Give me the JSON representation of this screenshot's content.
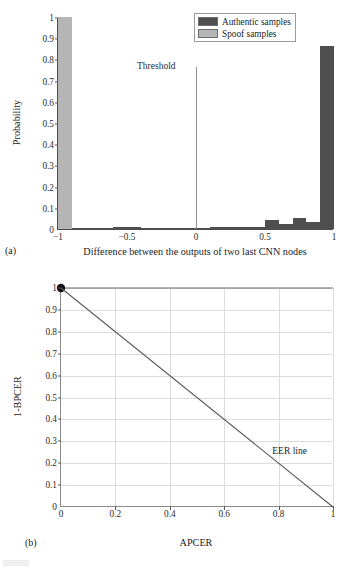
{
  "figure": {
    "background": "#ffffff"
  },
  "panel_a": {
    "subfig_label": "(a)",
    "threshold_label": "Threshold",
    "legend": {
      "items": [
        {
          "label": "Authentic samples",
          "color": "#4f4f4f"
        },
        {
          "label": "Spoof samples",
          "color": "#b5b5b5"
        }
      ]
    },
    "chart_data": {
      "type": "bar",
      "title": "",
      "xlabel": "Difference between the outputs of two last CNN nodes",
      "ylabel": "Probability",
      "xlim": [
        -1,
        1
      ],
      "ylim": [
        0,
        1
      ],
      "grid": false,
      "xticks": [
        "-1",
        "-0.5",
        "0",
        "0.5",
        "1"
      ],
      "xtick_values": [
        -1,
        -0.5,
        0,
        0.5,
        1
      ],
      "yticks": [
        "0",
        "0.1",
        "0.2",
        "0.3",
        "0.4",
        "0.5",
        "0.6",
        "0.7",
        "0.8",
        "0.9",
        "1"
      ],
      "ytick_values": [
        0,
        0.1,
        0.2,
        0.3,
        0.4,
        0.5,
        0.6,
        0.7,
        0.8,
        0.9,
        1
      ],
      "bin_width": 0.1,
      "threshold_x": 0,
      "series": [
        {
          "name": "Spoof samples",
          "color": "#b5b5b5",
          "bins_left": [
            -1.0,
            -0.9,
            -0.8,
            -0.7,
            -0.6,
            -0.5,
            -0.4,
            -0.3,
            -0.2,
            -0.1,
            0.0,
            0.1,
            0.2,
            0.3,
            0.4,
            0.5,
            0.6,
            0.7,
            0.8,
            0.9
          ],
          "values": [
            1.0,
            0.004,
            0.003,
            0.002,
            0.002,
            0.002,
            0.001,
            0.001,
            0.0,
            0.0,
            0.0,
            0.0,
            0.0,
            0.0,
            0.0,
            0.0,
            0.0,
            0.0,
            0.0,
            0.0
          ]
        },
        {
          "name": "Authentic samples",
          "color": "#4f4f4f",
          "bins_left": [
            -1.0,
            -0.9,
            -0.8,
            -0.7,
            -0.6,
            -0.5,
            -0.4,
            -0.3,
            -0.2,
            -0.1,
            0.0,
            0.1,
            0.2,
            0.3,
            0.4,
            0.5,
            0.6,
            0.7,
            0.8,
            0.9
          ],
          "values": [
            0.0,
            0.004,
            0.004,
            0.004,
            0.008,
            0.008,
            0.004,
            0.003,
            0.002,
            0.002,
            0.006,
            0.01,
            0.01,
            0.01,
            0.01,
            0.043,
            0.025,
            0.05,
            0.033,
            0.865
          ]
        }
      ]
    }
  },
  "panel_b": {
    "subfig_label": "(b)",
    "eer_annotation": "EER line",
    "chart_data": {
      "type": "line",
      "title": "",
      "xlabel": "APCER",
      "ylabel": "1-BPCER",
      "xlim": [
        0,
        1
      ],
      "ylim": [
        0,
        1
      ],
      "grid": true,
      "xticks": [
        "0",
        "0.2",
        "0.4",
        "0.6",
        "0.8",
        "1"
      ],
      "xtick_values": [
        0,
        0.2,
        0.4,
        0.6,
        0.8,
        1
      ],
      "yticks": [
        "0",
        "0.1",
        "0.2",
        "0.3",
        "0.4",
        "0.5",
        "0.6",
        "0.7",
        "0.8",
        "0.9",
        "1"
      ],
      "ytick_values": [
        0,
        0.1,
        0.2,
        0.3,
        0.4,
        0.5,
        0.6,
        0.7,
        0.8,
        0.9,
        1
      ],
      "series": [
        {
          "name": "ROC curve",
          "color": "#6b6b6b",
          "x": [
            0,
            1
          ],
          "y": [
            1,
            1
          ],
          "marker_point": [
            0,
            1
          ]
        },
        {
          "name": "EER line",
          "color": "#5a5a5a",
          "x": [
            0,
            1
          ],
          "y": [
            1,
            0
          ]
        }
      ]
    }
  }
}
